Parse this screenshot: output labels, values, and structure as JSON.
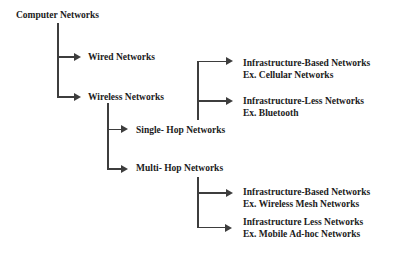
{
  "colors": {
    "text": "#1b1b1b",
    "line": "#3d3d3d",
    "background": "#ffffff"
  },
  "tree": {
    "root": "Computer Networks",
    "children": [
      {
        "label": "Wired Networks"
      },
      {
        "label": "Wireless Networks",
        "children": [
          {
            "label": "Single- Hop Networks",
            "children": [
              {
                "label": "Infrastructure-Based Networks",
                "example": "Ex. Cellular Networks"
              },
              {
                "label": "Infrastructure-Less Networks",
                "example": "Ex. Bluetooth"
              }
            ]
          },
          {
            "label": "Multi- Hop Networks",
            "children": [
              {
                "label": "Infrastructure-Based Networks",
                "example": "Ex. Wireless Mesh Networks"
              },
              {
                "label": "Infrastructure Less Networks",
                "example": "Ex. Mobile Ad-hoc Networks"
              }
            ]
          }
        ]
      }
    ]
  }
}
